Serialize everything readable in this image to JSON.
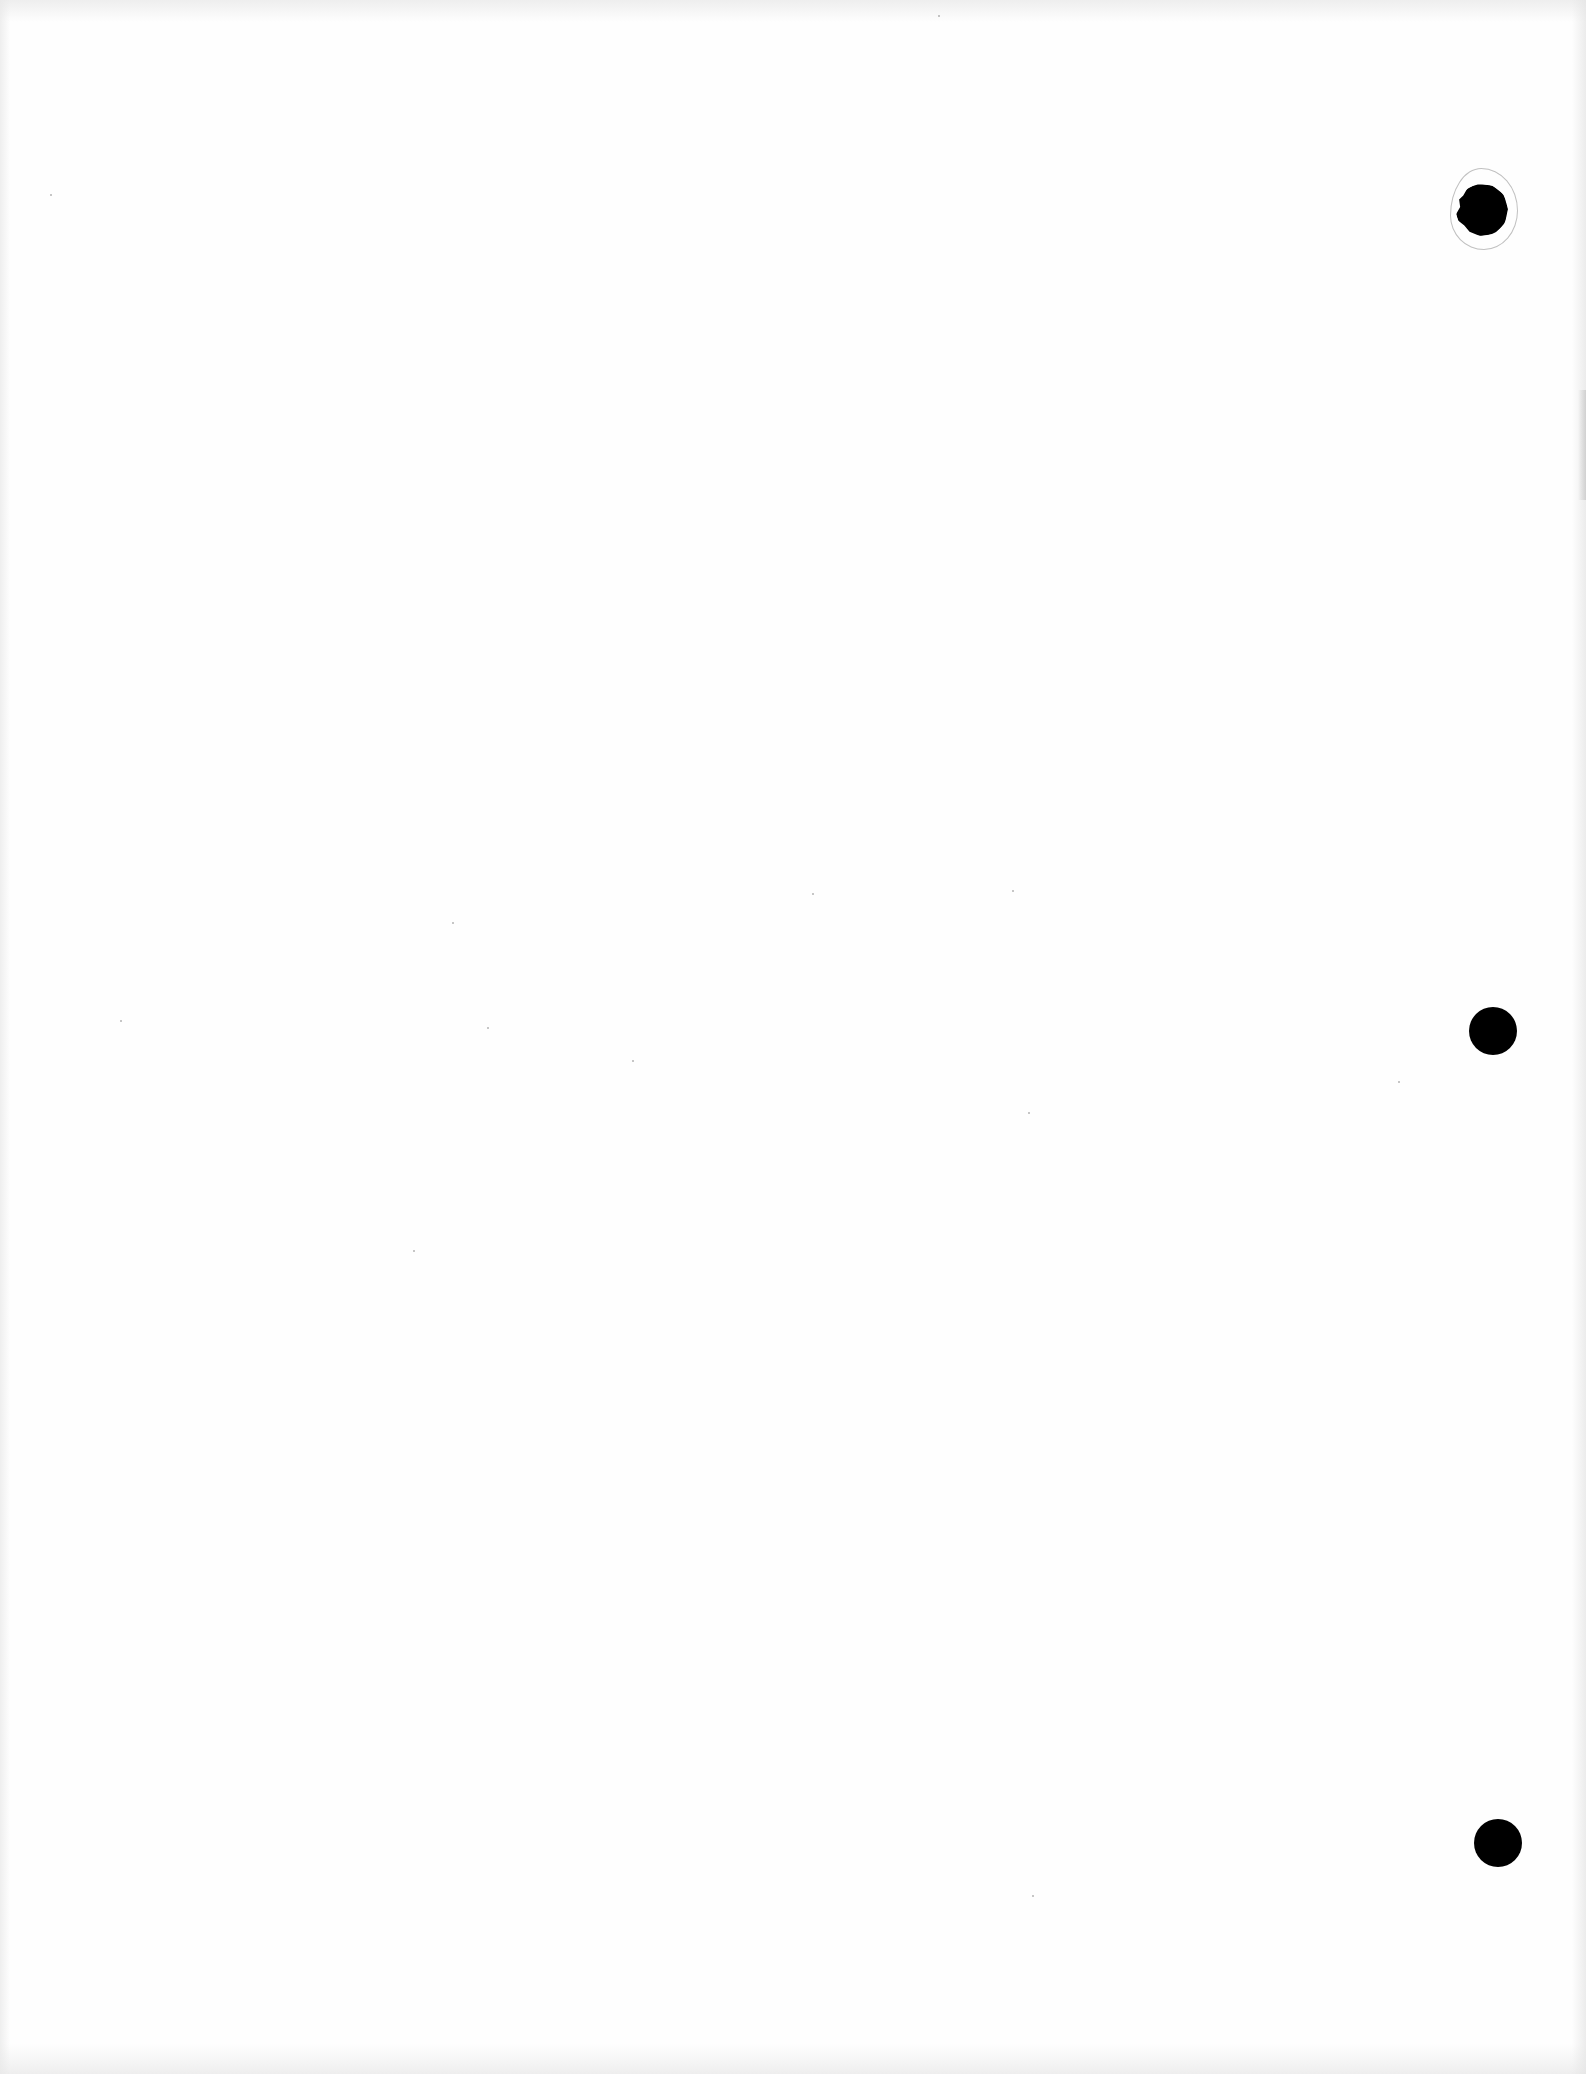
{
  "document": {
    "type": "blank scanned page",
    "background_color": "#fefefe",
    "text_content": ""
  },
  "binder_holes": [
    {
      "label": "top-hole",
      "cx": 1482,
      "cy": 210,
      "r": 26,
      "torn_edge": true,
      "color": "#000000"
    },
    {
      "label": "middle-hole",
      "cx": 1493,
      "cy": 1031,
      "r": 24,
      "torn_edge": false,
      "color": "#000000"
    },
    {
      "label": "bottom-hole",
      "cx": 1498,
      "cy": 1843,
      "r": 24,
      "torn_edge": false,
      "color": "#000000"
    }
  ],
  "specks": [
    {
      "x": 50,
      "y": 194
    },
    {
      "x": 120,
      "y": 1020
    },
    {
      "x": 452,
      "y": 922
    },
    {
      "x": 812,
      "y": 893
    },
    {
      "x": 1012,
      "y": 890
    },
    {
      "x": 487,
      "y": 1027
    },
    {
      "x": 1028,
      "y": 1112
    },
    {
      "x": 632,
      "y": 1060
    },
    {
      "x": 1032,
      "y": 1895
    },
    {
      "x": 1398,
      "y": 1081
    },
    {
      "x": 938,
      "y": 15
    },
    {
      "x": 413,
      "y": 1250
    }
  ]
}
